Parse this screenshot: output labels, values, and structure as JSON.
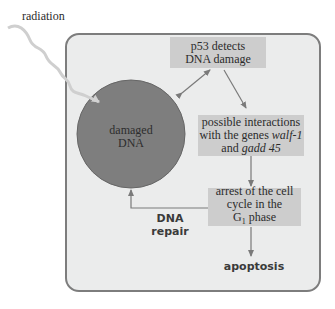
{
  "labels": {
    "radiation": "radiation",
    "circle_line1": "damaged",
    "circle_line2": "DNA",
    "p53_line1": "p53 detects",
    "p53_line2": "DNA damage",
    "interactions_line1": "possible interactions",
    "interactions_line2_prefix": "with the genes ",
    "interactions_gene1": "walf-1",
    "interactions_line3_prefix": "and ",
    "interactions_gene2": "gadd 45",
    "arrest_line1": "arrest of the cell",
    "arrest_line2": "cycle in the",
    "arrest_line3_G": "G",
    "arrest_line3_sub": "1",
    "arrest_line3_suffix": " phase",
    "repair_line1": "DNA",
    "repair_line2": "repair",
    "apoptosis": "apoptosis"
  },
  "colors": {
    "panel_bg": "#ebecec",
    "panel_border": "#7d7d7d",
    "box_fill": "#cdcdcd",
    "circle_fill": "#7e7e7e",
    "arrow": "#777777",
    "radiation_wave": "#c8c8c8"
  }
}
